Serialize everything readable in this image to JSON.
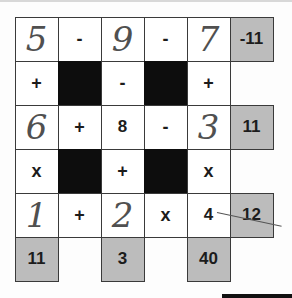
{
  "puzzle": {
    "type": "math-square-grid",
    "rows": [
      [
        {
          "kind": "number",
          "value": "5",
          "handwritten": true
        },
        {
          "kind": "op",
          "value": "-"
        },
        {
          "kind": "number",
          "value": "9",
          "handwritten": true
        },
        {
          "kind": "op",
          "value": "-"
        },
        {
          "kind": "number",
          "value": "7",
          "handwritten": true
        },
        {
          "kind": "result",
          "value": "-11"
        }
      ],
      [
        {
          "kind": "op",
          "value": "+"
        },
        {
          "kind": "black",
          "value": ""
        },
        {
          "kind": "op",
          "value": "-"
        },
        {
          "kind": "black",
          "value": ""
        },
        {
          "kind": "op",
          "value": "+"
        },
        {
          "kind": "empty",
          "value": ""
        }
      ],
      [
        {
          "kind": "number",
          "value": "6",
          "handwritten": true
        },
        {
          "kind": "op",
          "value": "+"
        },
        {
          "kind": "number",
          "value": "8",
          "handwritten": false
        },
        {
          "kind": "op",
          "value": "-"
        },
        {
          "kind": "number",
          "value": "3",
          "handwritten": true
        },
        {
          "kind": "result",
          "value": "11"
        }
      ],
      [
        {
          "kind": "op",
          "value": "x"
        },
        {
          "kind": "black",
          "value": ""
        },
        {
          "kind": "op",
          "value": "+"
        },
        {
          "kind": "black",
          "value": ""
        },
        {
          "kind": "op",
          "value": "x"
        },
        {
          "kind": "empty",
          "value": ""
        }
      ],
      [
        {
          "kind": "number",
          "value": "1",
          "handwritten": true
        },
        {
          "kind": "op",
          "value": "+"
        },
        {
          "kind": "number",
          "value": "2",
          "handwritten": true
        },
        {
          "kind": "op",
          "value": "x"
        },
        {
          "kind": "number",
          "value": "4",
          "handwritten": false
        },
        {
          "kind": "result",
          "value": "12",
          "struck": true
        }
      ],
      [
        {
          "kind": "result",
          "value": "11"
        },
        {
          "kind": "empty",
          "value": ""
        },
        {
          "kind": "result",
          "value": "3"
        },
        {
          "kind": "empty",
          "value": ""
        },
        {
          "kind": "result",
          "value": "40"
        },
        {
          "kind": "empty",
          "value": ""
        }
      ]
    ]
  },
  "colors": {
    "result_cell": "#bcbcbc",
    "black_cell": "#0d0d0d",
    "grid_line": "#3a3a3a",
    "handwriting": "#505050"
  }
}
